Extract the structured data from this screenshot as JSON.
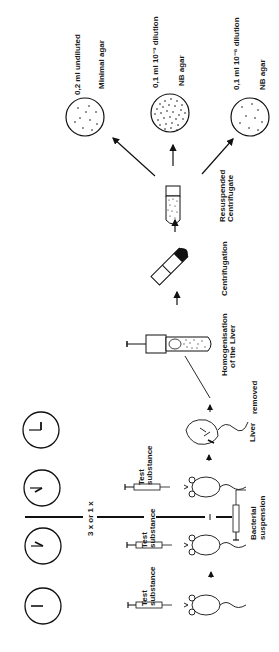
{
  "diagram": {
    "orientation": "rotated -90deg (flow reads bottom to top)",
    "plates": [
      {
        "volume": "0,2 ml undiluted",
        "medium": "Minimal agar",
        "density": "sparse"
      },
      {
        "volume": "0,1 ml 10⁻³ dilution",
        "medium": "NB agar",
        "density": "dense"
      },
      {
        "volume": "0,1 ml 10⁻⁶ dilution",
        "medium": "NB agar",
        "density": "sparse"
      }
    ],
    "steps": {
      "resuspended_line1": "Resuspended",
      "resuspended_line2": "Centrifugate",
      "centrifugation": "Centrifugation",
      "homogenisation_line1": "Homogenisation",
      "homogenisation_line2": "of the Liver",
      "liver": "Liver",
      "removed": "removed"
    },
    "injections": {
      "test1_line1": "Test",
      "test1_line2": "substance",
      "test2_line1": "Test",
      "test2_line2": "substance",
      "test3_line1": "Test",
      "test3_line2": "substance",
      "bacterial_line1": "Bacterial",
      "bacterial_line2": "suspension"
    },
    "repeat_label": "3 x  or  1 x",
    "clocks": [
      {
        "hour_hand": "12",
        "minute_hand": "12"
      },
      {
        "hour_hand": "~2",
        "minute_hand": "12"
      },
      {
        "hour_hand": "~4",
        "minute_hand": "12"
      },
      {
        "hour_hand": "3",
        "minute_hand": "12"
      }
    ]
  }
}
